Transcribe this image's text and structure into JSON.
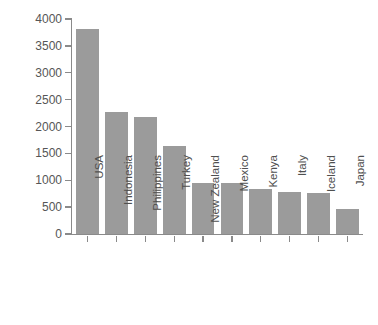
{
  "chart_data": {
    "type": "bar",
    "title": "",
    "xlabel": "",
    "ylabel": "Installed Capacity (MW)",
    "categories": [
      "USA",
      "Indonesia",
      "Philippines",
      "Turkey",
      "New Zealand",
      "Mexico",
      "Kenya",
      "Italy",
      "Iceland",
      "Japan"
    ],
    "values": [
      3820,
      2270,
      2180,
      1630,
      950,
      940,
      830,
      790,
      760,
      470
    ],
    "ylim": [
      0,
      4000
    ],
    "yticks": [
      0,
      500,
      1000,
      1500,
      2000,
      2500,
      3000,
      3500,
      4000
    ],
    "ytick_labels": [
      "0",
      "500",
      "1000",
      "1500",
      "2000",
      "2500",
      "3000",
      "3500",
      "4000"
    ],
    "grid": false,
    "legend": null,
    "bar_color": "#9b9b9b",
    "axis_color": "#8a8a8a",
    "text_color": "#4f4f4f",
    "background": "#ffffff"
  }
}
